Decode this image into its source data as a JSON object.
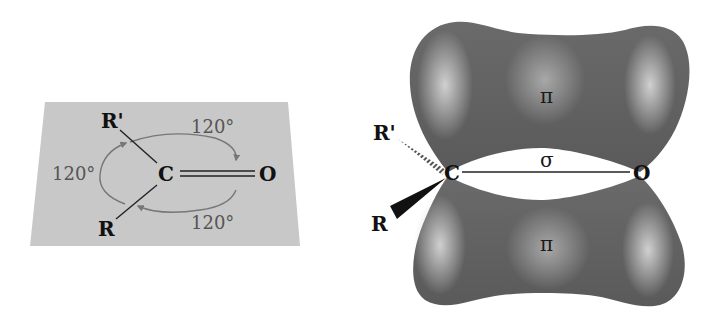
{
  "left_panel": {
    "title": "trigonal planar carbonyl",
    "atoms": {
      "carbon": "C",
      "oxygen": "O",
      "r_group": "R",
      "r_prime_group": "R'"
    },
    "angles": {
      "top": "120°",
      "left": "120°",
      "bottom": "120°"
    },
    "colors": {
      "plane": "#c8c8c8",
      "arc": "#777777",
      "bond": "#222222"
    }
  },
  "right_panel": {
    "title": "pi and sigma bonding orbitals",
    "atoms": {
      "carbon": "C",
      "oxygen": "O",
      "r_group": "R",
      "r_prime_group": "R'"
    },
    "orbitals": {
      "top_lobe": "π",
      "bottom_lobe": "π",
      "sigma_bond": "σ"
    },
    "colors": {
      "lobe_dark": "#4a4a4a",
      "lobe_mid": "#7a7a7a",
      "lobe_light": "#c4c4c4"
    }
  }
}
